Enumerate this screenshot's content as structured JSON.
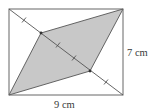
{
  "diagram": {
    "type": "geometry",
    "rectangle": {
      "x": 9,
      "y": 9,
      "width": 114,
      "height": 86
    },
    "diagonal": {
      "from": [
        9,
        9
      ],
      "to": [
        123,
        95
      ]
    },
    "parallelogram": {
      "vertices": [
        [
          9,
          95
        ],
        [
          41,
          33
        ],
        [
          123,
          9
        ],
        [
          90,
          71
        ]
      ],
      "fill": "#c8c8c8",
      "stroke": "#555555"
    },
    "tick_marks": [
      [
        24,
        20
      ],
      [
        58,
        45
      ],
      [
        74,
        58
      ],
      [
        106,
        82
      ]
    ],
    "labels": {
      "height": "7 cm",
      "width": "9 cm"
    },
    "colors": {
      "line": "#5a5a5a",
      "shade": "#c8c8c8",
      "background": "#ffffff"
    }
  }
}
